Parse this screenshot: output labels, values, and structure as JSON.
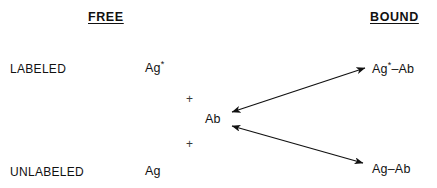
{
  "diagram": {
    "background_color": "#ffffff",
    "text_color": "#111111",
    "headers": {
      "left": "FREE",
      "right": "BOUND"
    },
    "row_labels": {
      "top": "LABELED",
      "bottom": "UNLABELED"
    },
    "species": {
      "labeled_antigen_base": "Ag",
      "labeled_antigen_mark": "*",
      "unlabeled_antigen": "Ag",
      "antibody": "Ab",
      "bound_labeled_complex_base": "Ag",
      "bound_labeled_complex_mark": "*",
      "bound_labeled_complex_suffix": "–Ab",
      "bound_unlabeled_complex": "Ag–Ab"
    },
    "operators": {
      "plus_top": "+",
      "plus_bottom": "+"
    },
    "arrows": [
      {
        "name": "labeled-binding-equilibrium",
        "from": "Ab",
        "to": "Ag*–Ab",
        "double_headed": true,
        "x1": 232,
        "y1": 112,
        "x2": 365,
        "y2": 68,
        "color": "#111111"
      },
      {
        "name": "unlabeled-binding-equilibrium",
        "from": "Ab",
        "to": "Ag–Ab",
        "double_headed": true,
        "x1": 232,
        "y1": 126,
        "x2": 363,
        "y2": 163,
        "color": "#111111"
      }
    ]
  }
}
